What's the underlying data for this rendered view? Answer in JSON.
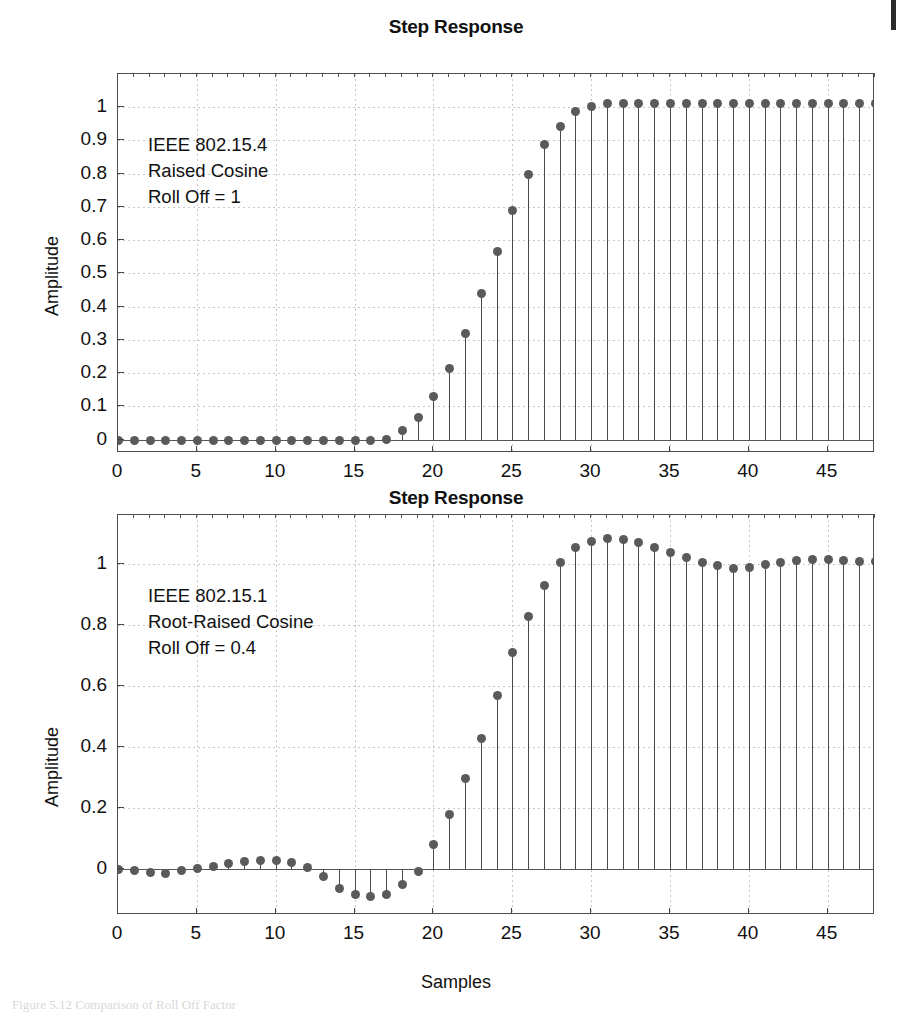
{
  "page": {
    "caption": "Figure 5.12  Comparison of Roll Off Factor",
    "edge_mark": "page-edge-scan-artifact"
  },
  "chart_data": [
    {
      "id": "top",
      "type": "line",
      "plot_style": "stem",
      "title": "Step Response",
      "xlabel": "",
      "ylabel": "Amplitude",
      "xlim": [
        0,
        48
      ],
      "ylim": [
        -0.04,
        1.1
      ],
      "xticks": [
        0,
        5,
        10,
        15,
        20,
        25,
        30,
        35,
        40,
        45
      ],
      "yticks": [
        0,
        0.1,
        0.2,
        0.3,
        0.4,
        0.5,
        0.6,
        0.7,
        0.8,
        0.9,
        1
      ],
      "ytick_labels": [
        "0",
        "0.1",
        "0.2",
        "0.3",
        "0.4",
        "0.5",
        "0.6",
        "0.7",
        "0.8",
        "0.9",
        "1"
      ],
      "xtick_labels": [
        "0",
        "5",
        "10",
        "15",
        "20",
        "25",
        "30",
        "35",
        "40",
        "45"
      ],
      "grid": true,
      "legend": "none",
      "annotation": [
        "IEEE 802.15.4",
        "Raised Cosine",
        "Roll Off = 1"
      ],
      "marker_color": "#5a5a5a",
      "x": [
        0,
        1,
        2,
        3,
        4,
        5,
        6,
        7,
        8,
        9,
        10,
        11,
        12,
        13,
        14,
        15,
        16,
        17,
        18,
        19,
        20,
        21,
        22,
        23,
        24,
        25,
        26,
        27,
        28,
        29,
        30,
        31,
        32,
        33,
        34,
        35,
        36,
        37,
        38,
        39,
        40,
        41,
        42,
        43,
        44,
        45,
        46,
        47,
        48
      ],
      "values": [
        0,
        0,
        0,
        0,
        0,
        0,
        0,
        0,
        0,
        0,
        0,
        0,
        0,
        0,
        0,
        0,
        0,
        0.002,
        0.03,
        0.068,
        0.13,
        0.215,
        0.32,
        0.44,
        0.567,
        0.69,
        0.8,
        0.888,
        0.945,
        0.99,
        1.005,
        1.013,
        1.013,
        1.012,
        1.012,
        1.012,
        1.012,
        1.012,
        1.012,
        1.012,
        1.012,
        1.012,
        1.012,
        1.012,
        1.012,
        1.012,
        1.012,
        1.012,
        1.012
      ]
    },
    {
      "id": "bottom",
      "type": "line",
      "plot_style": "stem",
      "title": "Step Response",
      "xlabel": "Samples",
      "ylabel": "Amplitude",
      "xlim": [
        0,
        48
      ],
      "ylim": [
        -0.15,
        1.16
      ],
      "xticks": [
        0,
        5,
        10,
        15,
        20,
        25,
        30,
        35,
        40,
        45
      ],
      "yticks": [
        0,
        0.2,
        0.4,
        0.6,
        0.8,
        1
      ],
      "ytick_labels": [
        "0",
        "0.2",
        "0.4",
        "0.6",
        "0.8",
        "1"
      ],
      "xtick_labels": [
        "0",
        "5",
        "10",
        "15",
        "20",
        "25",
        "30",
        "35",
        "40",
        "45"
      ],
      "grid": true,
      "legend": "none",
      "annotation": [
        "IEEE 802.15.1",
        "Root-Raised Cosine",
        "Roll Off = 0.4"
      ],
      "marker_color": "#5a5a5a",
      "x": [
        0,
        1,
        2,
        3,
        4,
        5,
        6,
        7,
        8,
        9,
        10,
        11,
        12,
        13,
        14,
        15,
        16,
        17,
        18,
        19,
        20,
        21,
        22,
        23,
        24,
        25,
        26,
        27,
        28,
        29,
        30,
        31,
        32,
        33,
        34,
        35,
        36,
        37,
        38,
        39,
        40,
        41,
        42,
        43,
        44,
        45,
        46,
        47,
        48
      ],
      "values": [
        0,
        -0.004,
        -0.008,
        -0.012,
        -0.004,
        0.004,
        0.012,
        0.021,
        0.026,
        0.03,
        0.031,
        0.022,
        0.006,
        -0.022,
        -0.062,
        -0.082,
        -0.089,
        -0.08,
        -0.05,
        -0.006,
        0.082,
        0.18,
        0.3,
        0.43,
        0.57,
        0.71,
        0.83,
        0.93,
        1.005,
        1.055,
        1.075,
        1.085,
        1.083,
        1.07,
        1.055,
        1.038,
        1.022,
        1.005,
        0.995,
        0.988,
        0.99,
        0.998,
        1.006,
        1.012,
        1.015,
        1.016,
        1.013,
        1.01,
        1.01
      ]
    }
  ]
}
